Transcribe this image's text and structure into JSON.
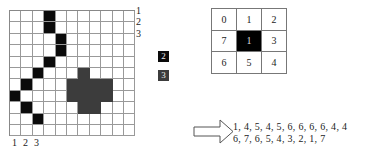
{
  "grid": {
    "cols": 11,
    "rows": 11,
    "black_cells": [
      [
        0,
        3
      ],
      [
        1,
        3
      ],
      [
        2,
        4
      ],
      [
        3,
        4
      ],
      [
        4,
        3
      ],
      [
        5,
        2
      ],
      [
        6,
        1
      ],
      [
        7,
        0
      ],
      [
        8,
        1
      ],
      [
        9,
        2
      ]
    ],
    "gray_cells": [
      [
        5,
        6
      ],
      [
        6,
        5
      ],
      [
        6,
        6
      ],
      [
        6,
        7
      ],
      [
        6,
        8
      ],
      [
        7,
        5
      ],
      [
        7,
        6
      ],
      [
        7,
        7
      ],
      [
        7,
        8
      ],
      [
        8,
        6
      ],
      [
        8,
        7
      ]
    ],
    "row_labels": [
      "1",
      "2",
      "3"
    ],
    "col_labels": [
      "1",
      "2",
      "3"
    ]
  },
  "legend": [
    {
      "label": "2",
      "color": "#0b0b0b"
    },
    {
      "label": "3",
      "color": "#3c3c3c"
    }
  ],
  "kernel": {
    "cells": [
      "0",
      "1",
      "2",
      "7",
      "1",
      "3",
      "6",
      "5",
      "4"
    ],
    "center_index": 4
  },
  "chain_code": {
    "line1": "1, 4, 5, 4, 5, 6, 6, 6, 6, 4, 4",
    "line2": "6, 7, 6, 5, 4, 3, 2, 1, 7"
  }
}
